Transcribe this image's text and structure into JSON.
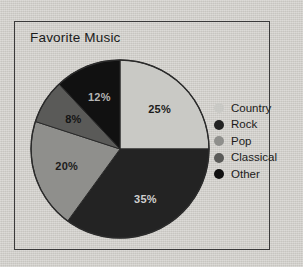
{
  "background": {
    "page_color": "#d2d0cb",
    "frame_border_color": "#3a3a3a"
  },
  "chart_title": "Favorite Music",
  "chart_data": {
    "type": "pie",
    "title": "Favorite Music",
    "xlabel": "",
    "ylabel": "",
    "categories": [
      "Country",
      "Rock",
      "Pop",
      "Classical",
      "Other"
    ],
    "values": [
      25,
      35,
      20,
      8,
      12
    ],
    "value_labels": [
      "25%",
      "35%",
      "20%",
      "8%",
      "12%"
    ],
    "units": "percent",
    "total": 100,
    "start_angle_deg": 0,
    "direction": "clockwise",
    "legend_position": "right",
    "grid": false,
    "colors": [
      "#c9c9c5",
      "#232323",
      "#8f8f8c",
      "#5a5a58",
      "#111111"
    ],
    "label_colors": [
      "#1b1b1b",
      "#d8d8d8",
      "#1b1b1b",
      "#1b1b1b",
      "#bdbdbd"
    ],
    "slices": [
      {
        "name": "Country",
        "value": 25,
        "label": "25%",
        "color": "#c9c9c5",
        "label_color": "#1b1b1b"
      },
      {
        "name": "Rock",
        "value": 35,
        "label": "35%",
        "color": "#232323",
        "label_color": "#d0d0d0"
      },
      {
        "name": "Pop",
        "value": 20,
        "label": "20%",
        "color": "#8f8f8c",
        "label_color": "#1b1b1b"
      },
      {
        "name": "Classical",
        "value": 8,
        "label": "8%",
        "color": "#5a5a58",
        "label_color": "#141414"
      },
      {
        "name": "Other",
        "value": 12,
        "label": "12%",
        "color": "#111111",
        "label_color": "#b5b5b5"
      }
    ]
  },
  "legend": {
    "items": [
      {
        "label": "Country",
        "color": "#c9c9c5"
      },
      {
        "label": "Rock",
        "color": "#232323"
      },
      {
        "label": "Pop",
        "color": "#8f8f8c"
      },
      {
        "label": "Classical",
        "color": "#5a5a58"
      },
      {
        "label": "Other",
        "color": "#111111"
      }
    ]
  }
}
